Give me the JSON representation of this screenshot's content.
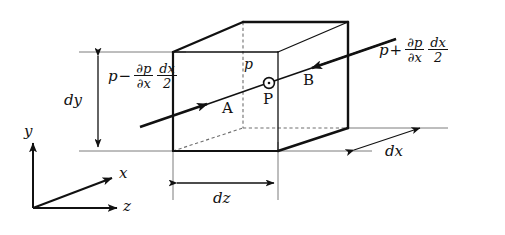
{
  "figure": {
    "type": "physics-diagram",
    "colors": {
      "ink": "#111111",
      "thin_line": "#6d6d6d",
      "dashed": "#7a7a7a",
      "background": "#ffffff"
    },
    "box": {
      "name": "fluid-element-cuboid",
      "front_face_label": "",
      "faces": [
        {
          "id": "A",
          "label": "A",
          "side": "left"
        },
        {
          "id": "B",
          "label": "B",
          "side": "right"
        }
      ]
    },
    "point": {
      "marker_label": "P",
      "pressure_label": "p",
      "name": "center-point-P"
    },
    "pressure_labels": {
      "left": {
        "lead": "p",
        "operator": "−",
        "frac1_num": "∂p",
        "frac1_den": "∂x",
        "frac2_num": "dx",
        "frac2_den": "2"
      },
      "right": {
        "lead": "p",
        "operator": "+",
        "frac1_num": "∂p",
        "frac1_den": "∂x",
        "frac2_num": "dx",
        "frac2_den": "2"
      }
    },
    "dimensions": [
      {
        "id": "dy",
        "label": "dy",
        "orientation": "vertical"
      },
      {
        "id": "dz",
        "label": "dz",
        "orientation": "horizontal"
      },
      {
        "id": "dx",
        "label": "dx",
        "orientation": "oblique"
      }
    ],
    "axes": {
      "name": "coordinate-triad",
      "y": "y",
      "x": "x",
      "z": "z"
    }
  }
}
